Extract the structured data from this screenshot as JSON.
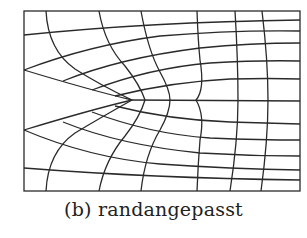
{
  "figure": {
    "caption": "(b) randangepasst",
    "colors": {
      "line": "#2a2a2a",
      "background": "#ffffff"
    }
  }
}
